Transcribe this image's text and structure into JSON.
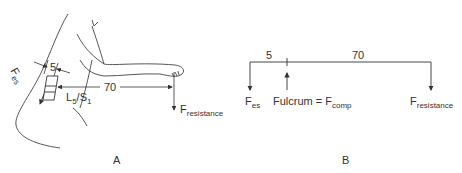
{
  "panel_a": {
    "label": "A",
    "f_es": {
      "main": "F",
      "sub": "es"
    },
    "short_arm": "5",
    "long_arm": "70",
    "vertebra": {
      "l": "L",
      "l_sub": "5",
      "slash": "/S",
      "s_sub": "1"
    },
    "f_resistance": {
      "main": "F",
      "sub": "resistance"
    }
  },
  "panel_b": {
    "label": "B",
    "short_arm": "5",
    "long_arm": "70",
    "f_es": {
      "main": "F",
      "sub": "es"
    },
    "fulcrum": {
      "prefix": "Fulcrum = F",
      "sub": "comp"
    },
    "f_resistance": {
      "main": "F",
      "sub": "resistance"
    }
  },
  "colors": {
    "line": "#333333",
    "background": "#ffffff"
  }
}
